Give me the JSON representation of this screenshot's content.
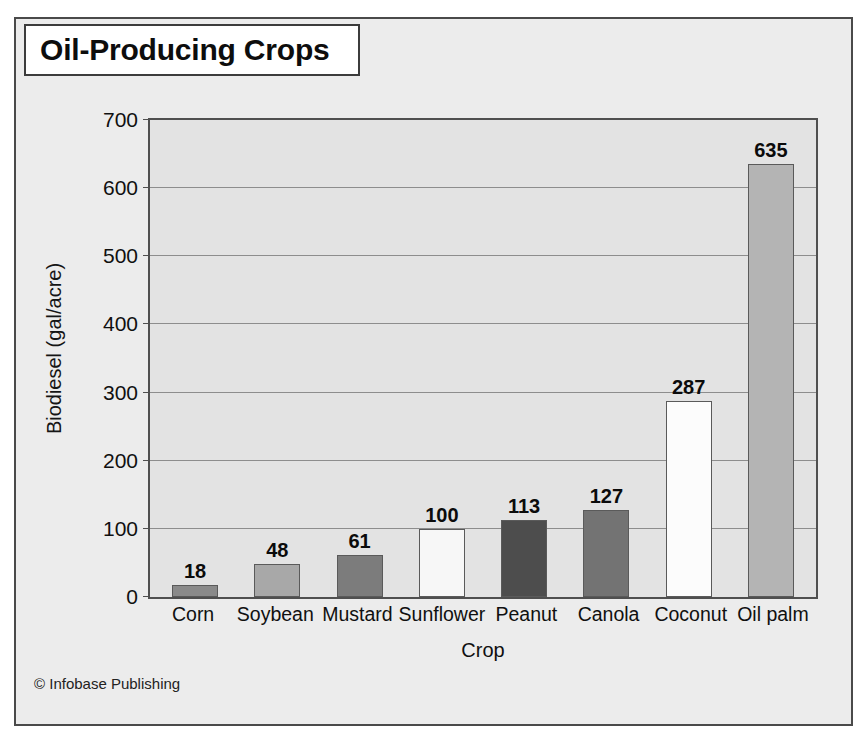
{
  "title": "Oil-Producing Crops",
  "credit": "© Infobase Publishing",
  "colors": {
    "page_background": "#ffffff",
    "figure_background": "#ececec",
    "plot_background": "#e3e3e3",
    "frame_border": "#4a4a4a",
    "gridline": "#8d8d8d",
    "text": "#101010"
  },
  "chart_data": {
    "type": "bar",
    "title": "Oil-Producing Crops",
    "xlabel": "Crop",
    "ylabel": "Biodiesel (gal/acre)",
    "categories": [
      "Corn",
      "Soybean",
      "Mustard",
      "Sunflower",
      "Peanut",
      "Canola",
      "Coconut",
      "Oil palm"
    ],
    "values": [
      18,
      48,
      61,
      100,
      113,
      127,
      287,
      635
    ],
    "bar_colors": [
      "#8a8a8a",
      "#a8a8a8",
      "#7c7c7c",
      "#f7f7f7",
      "#4d4d4d",
      "#737373",
      "#fcfcfc",
      "#b4b4b4"
    ],
    "ylim": [
      0,
      700
    ],
    "yticks": [
      0,
      100,
      200,
      300,
      400,
      500,
      600,
      700
    ],
    "ytick_labels": [
      "0",
      "100",
      "200",
      "300",
      "400",
      "500",
      "600",
      "700"
    ],
    "grid": true,
    "legend": false,
    "value_labels": [
      "18",
      "48",
      "61",
      "100",
      "113",
      "127",
      "287",
      "635"
    ]
  }
}
